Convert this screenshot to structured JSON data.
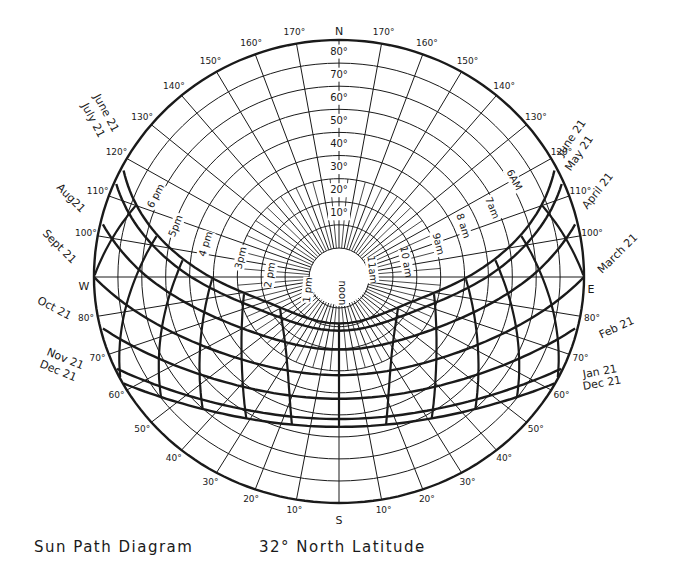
{
  "title": "Sun Path Diagram",
  "latitude_label": "32° North Latitude",
  "colors": {
    "ink": "#1a1a1a",
    "paper": "#ffffff"
  },
  "geometry": {
    "center": [
      339,
      277
    ],
    "radius_x": 245,
    "radius_top": 237,
    "radius_bottom": 226,
    "inner_hole_radius": 30
  },
  "compass": [
    {
      "label": "N",
      "x": 339,
      "y": 32
    },
    {
      "label": "S",
      "x": 339,
      "y": 521
    },
    {
      "label": "W",
      "x": 84,
      "y": 287
    },
    {
      "label": "E",
      "x": 591,
      "y": 290
    }
  ],
  "altitude_rings": [
    "10°",
    "20°",
    "30°",
    "40°",
    "50°",
    "60°",
    "70°",
    "80°"
  ],
  "azimuth_labels_left": [
    "170°",
    "160°",
    "150°",
    "140°",
    "130°",
    "120°",
    "110°",
    "100°",
    "80°",
    "70°",
    "60°",
    "50°",
    "40°",
    "30°",
    "20°",
    "10°"
  ],
  "azimuth_labels_right": [
    "170°",
    "160°",
    "150°",
    "140°",
    "130°",
    "120°",
    "110°",
    "100°",
    "80°",
    "70°",
    "60°",
    "50°",
    "40°",
    "30°",
    "20°",
    "10°"
  ],
  "date_labels_left": [
    {
      "text": "June 21",
      "x": 96,
      "y": 95,
      "rot": 62
    },
    {
      "text": "July 21",
      "x": 84,
      "y": 104,
      "rot": 62
    },
    {
      "text": "Aug21",
      "x": 58,
      "y": 186,
      "rot": 45
    },
    {
      "text": "Sept 21",
      "x": 44,
      "y": 232,
      "rot": 45
    },
    {
      "text": "Oct 21",
      "x": 38,
      "y": 300,
      "rot": 28
    },
    {
      "text": "Nov 21",
      "x": 47,
      "y": 352,
      "rot": 22
    },
    {
      "text": "Dec 21",
      "x": 40,
      "y": 364,
      "rot": 22
    }
  ],
  "date_labels_right": [
    {
      "text": "June 21",
      "x": 560,
      "y": 155,
      "rot": -55
    },
    {
      "text": "May 21",
      "x": 568,
      "y": 170,
      "rot": -55
    },
    {
      "text": "April 21",
      "x": 585,
      "y": 208,
      "rot": -52
    },
    {
      "text": "March 21",
      "x": 600,
      "y": 272,
      "rot": -45
    },
    {
      "text": "Feb 21",
      "x": 600,
      "y": 336,
      "rot": -25
    },
    {
      "text": "Jan 21",
      "x": 583,
      "y": 375,
      "rot": -10
    },
    {
      "text": "Dec 21",
      "x": 583,
      "y": 387,
      "rot": -10
    }
  ],
  "hour_labels": [
    {
      "text": "6 pm",
      "x": 156,
      "y": 196,
      "rot": -62
    },
    {
      "text": "5pm",
      "x": 176,
      "y": 226,
      "rot": -68
    },
    {
      "text": "4 pm",
      "x": 206,
      "y": 244,
      "rot": -72
    },
    {
      "text": "3pm",
      "x": 241,
      "y": 258,
      "rot": -76
    },
    {
      "text": "2 pm",
      "x": 270,
      "y": 275,
      "rot": -80
    },
    {
      "text": "1 pm",
      "x": 308,
      "y": 290,
      "rot": -84
    },
    {
      "text": "noon",
      "x": 342,
      "y": 293,
      "rot": 90
    },
    {
      "text": "11am",
      "x": 372,
      "y": 270,
      "rot": 84
    },
    {
      "text": "10 am",
      "x": 406,
      "y": 262,
      "rot": 80
    },
    {
      "text": "9am",
      "x": 438,
      "y": 244,
      "rot": 76
    },
    {
      "text": "8 am",
      "x": 463,
      "y": 226,
      "rot": 72
    },
    {
      "text": "7am",
      "x": 492,
      "y": 208,
      "rot": 68
    },
    {
      "text": "6AM",
      "x": 514,
      "y": 180,
      "rot": 62
    }
  ],
  "chart_data": {
    "type": "polar-sun-path",
    "title": "Sun Path Diagram",
    "subtitle": "32° North Latitude",
    "altitudes_deg": [
      10,
      20,
      30,
      40,
      50,
      60,
      70,
      80
    ],
    "azimuths_deg": [
      10,
      20,
      30,
      40,
      50,
      60,
      70,
      80,
      90,
      100,
      110,
      120,
      130,
      140,
      150,
      160,
      170,
      180
    ],
    "date_paths": [
      "June 21",
      "May 21 / July 21",
      "April 21 / Aug 21",
      "March 21 / Sept 21",
      "Feb 21 / Oct 21",
      "Jan 21 / Nov 21",
      "Dec 21"
    ],
    "hours": [
      "6AM",
      "7am",
      "8 am",
      "9am",
      "10 am",
      "11am",
      "noon",
      "1 pm",
      "2 pm",
      "3pm",
      "4 pm",
      "5pm",
      "6 pm"
    ]
  }
}
